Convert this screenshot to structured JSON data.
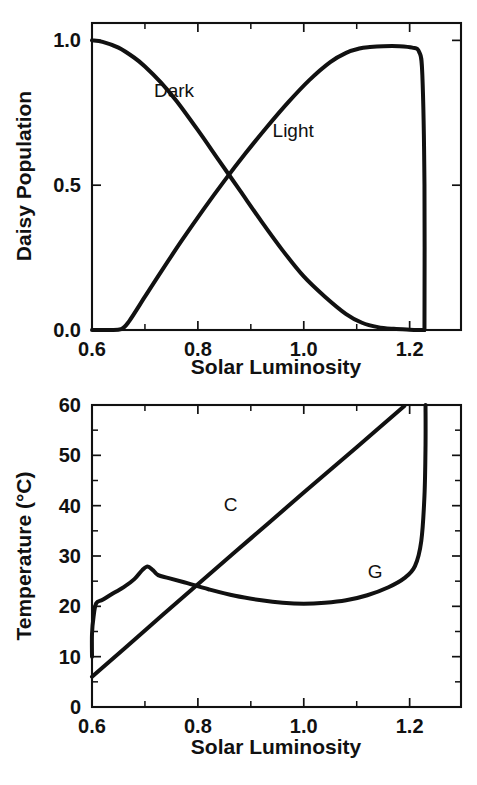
{
  "figure": {
    "title": "",
    "background_color": "#ffffff",
    "line_color": "#111111"
  },
  "chart_data": [
    {
      "id": "daisy-population",
      "type": "line",
      "title": "",
      "xlabel": "Solar Luminosity",
      "ylabel": "Daisy Population",
      "xlim": [
        0.6,
        1.297
      ],
      "ylim": [
        0.0,
        1.06
      ],
      "grid": false,
      "legend": "inline-annotations",
      "xticks": [
        0.6,
        0.8,
        1.0,
        1.2
      ],
      "xticklabels": [
        "0.6",
        "0.8",
        "1.0",
        "1.2"
      ],
      "xminorticks": [
        0.7,
        0.9,
        1.1
      ],
      "yticks": [
        0.0,
        0.5,
        1.0
      ],
      "yticklabels": [
        "0.0",
        "0.5",
        "1.0"
      ],
      "annotations": [
        {
          "text": "Dark",
          "x": 0.755,
          "y": 0.805
        },
        {
          "text": "Light",
          "x": 0.98,
          "y": 0.665
        }
      ],
      "series": [
        {
          "name": "Dark",
          "label": "Dark",
          "x": [
            0.6,
            0.62,
            0.65,
            0.68,
            0.7,
            0.73,
            0.76,
            0.8,
            0.84,
            0.88,
            0.92,
            0.96,
            1.0,
            1.04,
            1.08,
            1.11,
            1.14,
            1.17,
            1.2,
            1.215,
            1.228
          ],
          "values": [
            1.0,
            0.995,
            0.975,
            0.94,
            0.91,
            0.855,
            0.79,
            0.69,
            0.585,
            0.48,
            0.375,
            0.275,
            0.185,
            0.115,
            0.055,
            0.025,
            0.01,
            0.004,
            0.001,
            0.0,
            0.0
          ]
        },
        {
          "name": "Light",
          "label": "Light",
          "x": [
            0.6,
            0.63,
            0.655,
            0.67,
            0.7,
            0.73,
            0.77,
            0.81,
            0.85,
            0.89,
            0.93,
            0.97,
            1.01,
            1.05,
            1.08,
            1.105,
            1.125,
            1.15,
            1.18,
            1.205,
            1.218,
            1.224,
            1.228,
            1.228
          ],
          "values": [
            0.0,
            0.0,
            0.003,
            0.03,
            0.115,
            0.2,
            0.31,
            0.415,
            0.515,
            0.61,
            0.7,
            0.785,
            0.862,
            0.925,
            0.957,
            0.972,
            0.977,
            0.98,
            0.98,
            0.975,
            0.96,
            0.88,
            0.5,
            0.0
          ]
        }
      ]
    },
    {
      "id": "temperature",
      "type": "line",
      "title": "",
      "xlabel": "Solar Luminosity",
      "ylabel": "Temperature (°C)",
      "xlim": [
        0.6,
        1.297
      ],
      "ylim": [
        0,
        60
      ],
      "grid": false,
      "legend": "inline-annotations",
      "xticks": [
        0.6,
        0.8,
        1.0,
        1.2
      ],
      "xticklabels": [
        "0.6",
        "0.8",
        "1.0",
        "1.2"
      ],
      "xminorticks": [
        0.7,
        0.9,
        1.1
      ],
      "yticks": [
        0,
        10,
        20,
        30,
        40,
        50,
        60
      ],
      "yticklabels": [
        "0",
        "10",
        "20",
        "30",
        "40",
        "50",
        "60"
      ],
      "yminorticks": [
        5,
        15,
        25,
        35,
        45,
        55
      ],
      "annotations": [
        {
          "text": "C",
          "x": 0.862,
          "y": 39.0
        },
        {
          "text": "G",
          "x": 1.135,
          "y": 25.6
        }
      ],
      "series": [
        {
          "name": "C",
          "label": "C",
          "x": [
            0.6,
            0.7,
            0.8,
            0.9,
            1.0,
            1.1,
            1.19
          ],
          "values": [
            6.0,
            15.2,
            24.4,
            33.5,
            42.6,
            51.6,
            59.8
          ]
        },
        {
          "name": "G",
          "label": "G",
          "x": [
            0.6,
            0.6,
            0.603,
            0.608,
            0.62,
            0.64,
            0.66,
            0.68,
            0.695,
            0.705,
            0.715,
            0.725,
            0.745,
            0.78,
            0.82,
            0.87,
            0.92,
            0.96,
            1.0,
            1.04,
            1.08,
            1.12,
            1.16,
            1.19,
            1.21,
            1.222,
            1.228,
            1.23,
            1.23
          ],
          "values": [
            10.0,
            14.5,
            18.0,
            20.6,
            21.3,
            22.6,
            23.8,
            25.4,
            27.2,
            27.9,
            27.2,
            26.2,
            25.6,
            24.6,
            23.4,
            22.1,
            21.2,
            20.7,
            20.5,
            20.7,
            21.2,
            22.2,
            23.8,
            25.6,
            28.0,
            33.0,
            42.0,
            52.0,
            60.0
          ]
        }
      ]
    }
  ]
}
